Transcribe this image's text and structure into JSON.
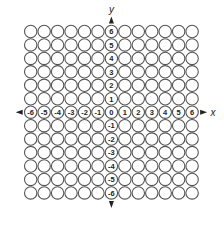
{
  "diagram": {
    "type": "coordinate-grid-circles",
    "axes": {
      "x_label": "x",
      "y_label": "y"
    },
    "x_ticks": [
      "-6",
      "-5",
      "-4",
      "-3",
      "-2",
      "-1",
      "0",
      "1",
      "2",
      "3",
      "4",
      "5",
      "6"
    ],
    "y_ticks_positive": [
      "6",
      "5",
      "4",
      "3",
      "2",
      "1"
    ],
    "y_ticks_negative": [
      "-1",
      "-2",
      "-3",
      "-4",
      "-5",
      "-6"
    ],
    "grid": {
      "columns": 13,
      "rows": 13,
      "cell_shape": "circle"
    },
    "colors": {
      "stroke": "#555555",
      "text": "#222222",
      "background": "#ffffff"
    }
  }
}
